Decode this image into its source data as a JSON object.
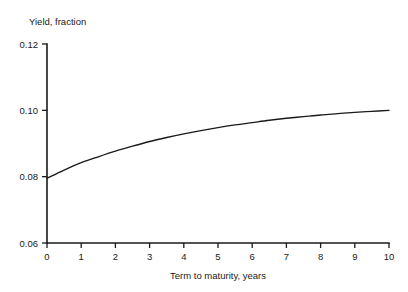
{
  "chart_data": {
    "type": "line",
    "title": "",
    "xlabel": "Term to maturity, years",
    "ylabel": "Yield, fraction",
    "xlim": [
      0,
      10
    ],
    "ylim": [
      0.06,
      0.12
    ],
    "xticks": [
      0,
      1,
      2,
      3,
      4,
      5,
      6,
      7,
      8,
      9,
      10
    ],
    "xtick_labels": [
      "0",
      "1",
      "2",
      "3",
      "4",
      "5",
      "6",
      "7",
      "8",
      "9",
      "10"
    ],
    "yticks": [
      0.06,
      0.08,
      0.1,
      0.12
    ],
    "ytick_labels": [
      "0.06",
      "0.08",
      "0.10",
      "0.12"
    ],
    "grid": false,
    "legend": false,
    "series": [
      {
        "name": "Yield curve",
        "color": "#1a1a1a",
        "x": [
          0,
          0.5,
          1,
          1.5,
          2,
          2.5,
          3,
          3.5,
          4,
          4.5,
          5,
          5.5,
          6,
          6.5,
          7,
          7.5,
          8,
          8.5,
          9,
          9.5,
          10
        ],
        "y": [
          0.0795,
          0.082,
          0.0842,
          0.086,
          0.0877,
          0.0892,
          0.0906,
          0.0918,
          0.0929,
          0.0939,
          0.0948,
          0.0956,
          0.0963,
          0.097,
          0.0976,
          0.0981,
          0.0986,
          0.099,
          0.0994,
          0.0997,
          0.1
        ]
      }
    ]
  },
  "axes": {
    "y_title": "Yield, fraction",
    "x_title": "Term to maturity, years"
  }
}
